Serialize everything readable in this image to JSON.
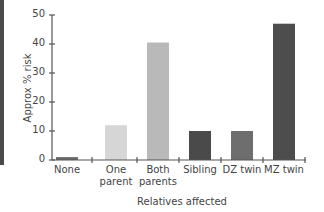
{
  "chart_data": {
    "type": "bar",
    "title": "",
    "xlabel": "Relatives affected",
    "ylabel": "Approx % risk",
    "categories": [
      "None",
      "One parent",
      "Both parents",
      "Sibling",
      "DZ twin",
      "MZ twin"
    ],
    "category_lines": [
      [
        "None"
      ],
      [
        "One",
        "parent"
      ],
      [
        "Both",
        "parents"
      ],
      [
        "Sibling"
      ],
      [
        "DZ twin"
      ],
      [
        "MZ twin"
      ]
    ],
    "values": [
      1,
      12,
      40.5,
      10,
      10,
      47
    ],
    "bar_colors": [
      "#6a6a6a",
      "#d6d6d6",
      "#b9b9b9",
      "#4a4a4a",
      "#6e6e6e",
      "#4d4d4d"
    ],
    "yticks": [
      0,
      10,
      20,
      30,
      40,
      50
    ],
    "ylim": [
      0,
      50
    ],
    "grid": false,
    "legend": null
  }
}
